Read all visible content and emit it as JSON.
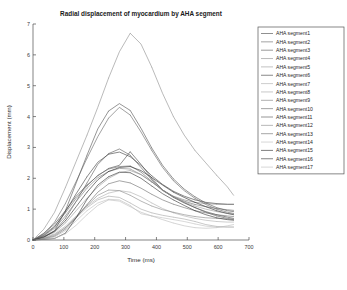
{
  "chart_data": {
    "type": "line",
    "title": "Radial displacement of myocardium by AHA segment",
    "xlabel": "Time (ms)",
    "ylabel": "Displacement (mm)",
    "xlim": [
      0,
      700
    ],
    "ylim": [
      0,
      7
    ],
    "xticks": [
      0,
      100,
      200,
      300,
      400,
      500,
      600,
      700
    ],
    "yticks": [
      0,
      1,
      2,
      3,
      4,
      5,
      6,
      7
    ],
    "grid": false,
    "legend_position": "right-outside",
    "x": [
      0,
      35,
      70,
      105,
      140,
      175,
      210,
      245,
      280,
      315,
      350,
      385,
      420,
      455,
      490,
      525,
      560,
      595,
      630,
      650
    ],
    "series": [
      {
        "name": "AHA segment1",
        "color": "#4a4a4a",
        "values": [
          0,
          0.22,
          0.52,
          0.95,
          1.42,
          1.78,
          2.08,
          2.32,
          2.42,
          2.86,
          2.45,
          2.0,
          1.62,
          1.38,
          1.2,
          1.05,
          0.92,
          0.82,
          0.74,
          0.7
        ]
      },
      {
        "name": "AHA segment2",
        "color": "#6b6b6b",
        "values": [
          0,
          0.18,
          0.45,
          0.88,
          1.35,
          1.75,
          2.1,
          2.3,
          2.38,
          2.4,
          2.2,
          1.9,
          1.6,
          1.4,
          1.26,
          1.15,
          1.08,
          1.02,
          0.98,
          0.96
        ]
      },
      {
        "name": "AHA segment3",
        "color": "#5a5a5a",
        "values": [
          0,
          0.12,
          0.3,
          0.7,
          1.25,
          1.85,
          2.45,
          2.8,
          2.95,
          2.75,
          2.35,
          1.95,
          1.62,
          1.4,
          1.22,
          1.05,
          0.9,
          0.78,
          0.7,
          0.66
        ]
      },
      {
        "name": "AHA segment4",
        "color": "#8f8f8f",
        "values": [
          0,
          0.35,
          0.9,
          1.7,
          2.55,
          3.4,
          4.3,
          5.25,
          6.1,
          6.7,
          6.35,
          5.6,
          4.75,
          4.0,
          3.4,
          2.9,
          2.5,
          2.1,
          1.72,
          1.45
        ]
      },
      {
        "name": "AHA segment5",
        "color": "#9a9a9a",
        "values": [
          0,
          0.1,
          0.25,
          0.55,
          0.95,
          1.35,
          1.72,
          2.0,
          2.18,
          2.25,
          2.12,
          1.88,
          1.62,
          1.4,
          1.24,
          1.1,
          1.0,
          0.92,
          0.86,
          0.84
        ]
      },
      {
        "name": "AHA segment6",
        "color": "#3f3f3f",
        "values": [
          0,
          0.15,
          0.42,
          0.92,
          1.5,
          2.05,
          2.52,
          2.78,
          2.85,
          2.7,
          2.42,
          2.08,
          1.8,
          1.58,
          1.42,
          1.3,
          1.22,
          1.18,
          1.16,
          1.16
        ]
      },
      {
        "name": "AHA segment7",
        "color": "#b0b0b0",
        "values": [
          0,
          0.08,
          0.2,
          0.45,
          0.78,
          1.1,
          1.35,
          1.52,
          1.6,
          1.55,
          1.4,
          1.2,
          1.02,
          0.88,
          0.78,
          0.7,
          0.64,
          0.6,
          0.58,
          0.58
        ]
      },
      {
        "name": "AHA segment8",
        "color": "#a8a8a8",
        "values": [
          0,
          0.06,
          0.18,
          0.4,
          0.72,
          1.05,
          1.3,
          1.42,
          1.38,
          1.2,
          1.0,
          0.88,
          0.8,
          0.74,
          0.68,
          0.6,
          0.5,
          0.44,
          0.42,
          0.42
        ]
      },
      {
        "name": "AHA segment9",
        "color": "#7d7d7d",
        "values": [
          0,
          0.14,
          0.38,
          0.78,
          1.25,
          1.68,
          2.02,
          2.22,
          2.32,
          2.3,
          2.12,
          1.88,
          1.62,
          1.42,
          1.3,
          1.22,
          1.18,
          1.16,
          1.15,
          1.15
        ]
      },
      {
        "name": "AHA segment10",
        "color": "#666666",
        "values": [
          0,
          0.2,
          0.58,
          1.18,
          1.9,
          2.65,
          3.35,
          3.95,
          4.3,
          4.05,
          3.5,
          2.9,
          2.35,
          1.92,
          1.6,
          1.35,
          1.15,
          1.0,
          0.9,
          0.86
        ]
      },
      {
        "name": "AHA segment11",
        "color": "#545454",
        "values": [
          0,
          0.08,
          0.3,
          0.95,
          1.85,
          2.75,
          3.6,
          4.18,
          4.42,
          4.2,
          3.62,
          2.98,
          2.42,
          1.98,
          1.65,
          1.4,
          1.2,
          1.05,
          0.95,
          0.92
        ]
      },
      {
        "name": "AHA segment12",
        "color": "#8a8a8a",
        "values": [
          0,
          0.05,
          0.15,
          0.4,
          0.75,
          1.12,
          1.45,
          1.62,
          1.6,
          1.45,
          1.26,
          1.1,
          0.98,
          0.9,
          0.82,
          0.76,
          0.72,
          0.7,
          0.68,
          0.68
        ]
      },
      {
        "name": "AHA segment13",
        "color": "#6f6f6f",
        "values": [
          0,
          0.04,
          0.12,
          0.35,
          0.72,
          1.15,
          1.55,
          1.82,
          1.92,
          1.85,
          1.68,
          1.48,
          1.3,
          1.16,
          1.05,
          0.95,
          0.88,
          0.82,
          0.78,
          0.76
        ]
      },
      {
        "name": "AHA segment14",
        "color": "#c0c0c0",
        "values": [
          0,
          0.03,
          0.1,
          0.3,
          0.62,
          0.95,
          1.2,
          1.32,
          1.3,
          1.12,
          0.85,
          0.78,
          0.72,
          0.66,
          0.6,
          0.52,
          0.45,
          0.42,
          0.42,
          0.42
        ]
      },
      {
        "name": "AHA segment15",
        "color": "#2e2e2e",
        "values": [
          0,
          0.1,
          0.28,
          0.62,
          1.08,
          1.55,
          1.95,
          2.22,
          2.35,
          2.38,
          2.25,
          2.02,
          1.78,
          1.55,
          1.38,
          1.22,
          1.08,
          0.95,
          0.86,
          0.82
        ]
      },
      {
        "name": "AHA segment16",
        "color": "#383838",
        "values": [
          0,
          0.02,
          0.05,
          0.22,
          0.72,
          1.32,
          1.78,
          2.05,
          2.2,
          2.18,
          2.0,
          1.75,
          1.5,
          1.3,
          1.12,
          0.95,
          0.82,
          0.72,
          0.66,
          0.64
        ]
      },
      {
        "name": "AHA segment17",
        "color": "#bdbdbd",
        "values": [
          0,
          0.02,
          0.06,
          0.2,
          0.48,
          0.82,
          1.12,
          1.3,
          1.26,
          1.08,
          0.9,
          0.78,
          0.66,
          0.55,
          0.46,
          0.4,
          0.38,
          0.4,
          0.46,
          0.5
        ]
      }
    ]
  }
}
